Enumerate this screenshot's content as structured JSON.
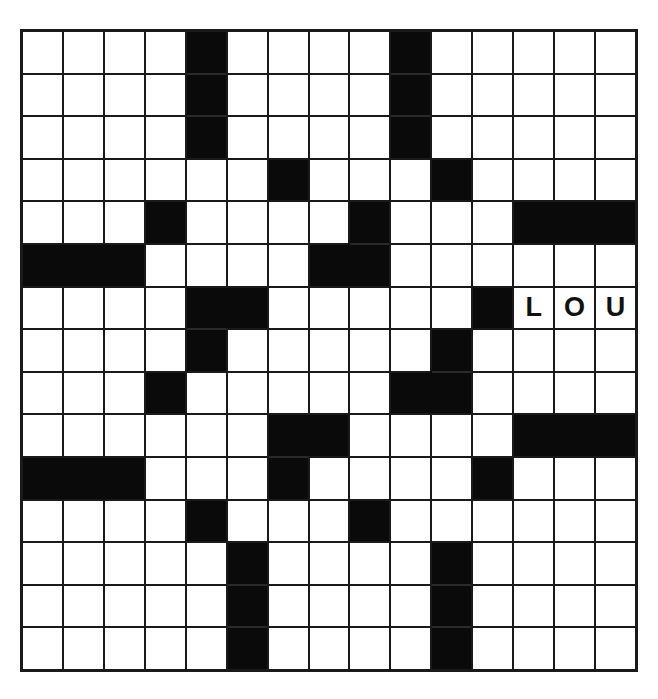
{
  "puzzle": {
    "rows": 15,
    "cols": 15,
    "colors": {
      "block": "#0a0a0a",
      "cell": "#ffffff",
      "grid_line": "#1a1a1a",
      "letter": "#111111"
    },
    "grid": [
      "....#....#.....",
      "....#....#.....",
      "....#....#.....",
      "......#...#....",
      "...#....#...###",
      "###....##......",
      "....##.....#LOU",
      "....#.....#....",
      "...#.....##....",
      "......##....###",
      "###...#....#...",
      "....#...#......",
      ".....#....#....",
      ".....#....#....",
      ".....#....#...."
    ],
    "entries": [
      {
        "row": 6,
        "col": 12,
        "letter": "L"
      },
      {
        "row": 6,
        "col": 13,
        "letter": "O"
      },
      {
        "row": 6,
        "col": 14,
        "letter": "U"
      }
    ]
  }
}
